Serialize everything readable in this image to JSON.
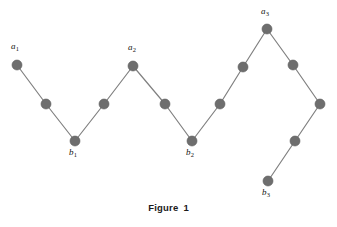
{
  "figure": {
    "caption_label": "Figure",
    "caption_number": "1",
    "background_color": "#ffffff",
    "node_color": "#6e6e6e",
    "node_stroke_color": "#5c5c5c",
    "edge_color": "#808080",
    "label_color": "#141414",
    "node_radius": 5,
    "edge_width": 1.2,
    "width": 337,
    "height": 227
  },
  "chart_data": {
    "type": "scatter",
    "xlabel": "",
    "ylabel": "",
    "xlim": [
      0,
      337
    ],
    "ylim": [
      227,
      0
    ],
    "grid": false,
    "legend": "none",
    "nodes": [
      {
        "id": "a1",
        "label": "a",
        "sub": "1",
        "x": 17,
        "y": 65,
        "labeled": true,
        "label_x": 11,
        "label_y": 42
      },
      {
        "id": "n2",
        "label": "",
        "sub": "",
        "x": 46,
        "y": 104,
        "labeled": false,
        "label_x": 0,
        "label_y": 0
      },
      {
        "id": "b1",
        "label": "b",
        "sub": "1",
        "x": 75,
        "y": 141,
        "labeled": true,
        "label_x": 69,
        "label_y": 148
      },
      {
        "id": "n4",
        "label": "",
        "sub": "",
        "x": 104,
        "y": 104,
        "labeled": false,
        "label_x": 0,
        "label_y": 0
      },
      {
        "id": "a2",
        "label": "a",
        "sub": "2",
        "x": 133,
        "y": 66,
        "labeled": true,
        "label_x": 128,
        "label_y": 43
      },
      {
        "id": "n6",
        "label": "",
        "sub": "",
        "x": 165,
        "y": 104,
        "labeled": false,
        "label_x": 0,
        "label_y": 0
      },
      {
        "id": "b2",
        "label": "b",
        "sub": "2",
        "x": 192,
        "y": 141,
        "labeled": true,
        "label_x": 186,
        "label_y": 148
      },
      {
        "id": "n8",
        "label": "",
        "sub": "",
        "x": 220,
        "y": 104,
        "labeled": false,
        "label_x": 0,
        "label_y": 0
      },
      {
        "id": "n9",
        "label": "",
        "sub": "",
        "x": 243,
        "y": 67,
        "labeled": false,
        "label_x": 0,
        "label_y": 0
      },
      {
        "id": "a3",
        "label": "a",
        "sub": "3",
        "x": 267,
        "y": 29,
        "labeled": true,
        "label_x": 261,
        "label_y": 7
      },
      {
        "id": "n11",
        "label": "",
        "sub": "",
        "x": 293,
        "y": 65,
        "labeled": false,
        "label_x": 0,
        "label_y": 0
      },
      {
        "id": "n12",
        "label": "",
        "sub": "",
        "x": 320,
        "y": 104,
        "labeled": false,
        "label_x": 0,
        "label_y": 0
      },
      {
        "id": "n13",
        "label": "",
        "sub": "",
        "x": 295,
        "y": 141,
        "labeled": false,
        "label_x": 0,
        "label_y": 0
      },
      {
        "id": "b3",
        "label": "b",
        "sub": "3",
        "x": 268,
        "y": 181,
        "labeled": true,
        "label_x": 262,
        "label_y": 188
      }
    ],
    "edges": [
      [
        "a1",
        "n2"
      ],
      [
        "n2",
        "b1"
      ],
      [
        "b1",
        "n4"
      ],
      [
        "n4",
        "a2"
      ],
      [
        "a2",
        "n6"
      ],
      [
        "n6",
        "b2"
      ],
      [
        "b2",
        "n8"
      ],
      [
        "n8",
        "n9"
      ],
      [
        "n9",
        "a3"
      ],
      [
        "a3",
        "n11"
      ],
      [
        "n11",
        "n12"
      ],
      [
        "n12",
        "n13"
      ],
      [
        "n13",
        "b3"
      ]
    ]
  }
}
